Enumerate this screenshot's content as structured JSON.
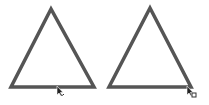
{
  "shapes": [
    {
      "type": "triangle",
      "points": "51,9 11,87 94,87",
      "stroke": "#555555",
      "stroke_width": 3.5
    },
    {
      "type": "triangle",
      "points": "150,8 109,87 191,87",
      "stroke": "#555555",
      "stroke_width": 3.5
    }
  ],
  "cursors": [
    {
      "x": 57,
      "y": 87,
      "badge": "link"
    },
    {
      "x": 188,
      "y": 88,
      "badge": "copy"
    }
  ],
  "colors": {
    "background": "#ffffff",
    "stroke": "#555555",
    "cursor": "#222222"
  }
}
